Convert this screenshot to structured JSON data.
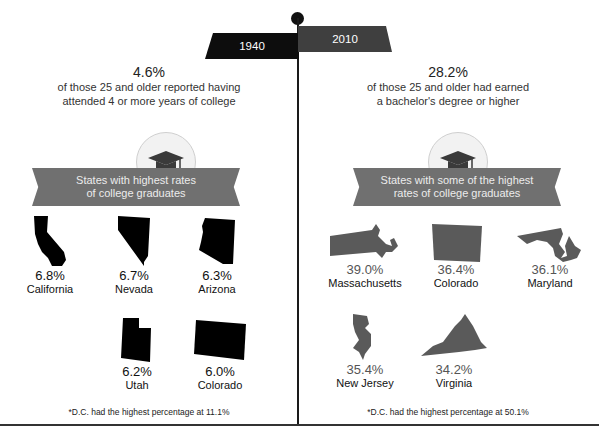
{
  "timeline": {
    "left_year": "1940",
    "right_year": "2010"
  },
  "left": {
    "percent": "4.6%",
    "description_line1": "of those 25 and older reported having",
    "description_line2": "attended 4 or more years of college",
    "icon": "graduation-cap-icon",
    "ribbon_line1": "States with highest rates",
    "ribbon_line2": "of college graduates",
    "states": [
      {
        "value": "6.8%",
        "name": "California",
        "shape": "california-map-icon"
      },
      {
        "value": "6.7%",
        "name": "Nevada",
        "shape": "nevada-map-icon"
      },
      {
        "value": "6.3%",
        "name": "Arizona",
        "shape": "arizona-map-icon"
      },
      {
        "value": "6.2%",
        "name": "Utah",
        "shape": "utah-map-icon"
      },
      {
        "value": "6.0%",
        "name": "Colorado",
        "shape": "colorado-map-icon"
      }
    ],
    "footnote": "*D.C. had the highest percentage at 11.1%",
    "shape_color": "#000000"
  },
  "right": {
    "percent": "28.2%",
    "description_line1": "of those 25 and older had earned",
    "description_line2": "a bachelor's degree or higher",
    "icon": "graduation-cap-icon",
    "ribbon_line1": "States with some of the highest",
    "ribbon_line2": "rates of college graduates",
    "states": [
      {
        "value": "39.0%",
        "name": "Massachusetts",
        "shape": "massachusetts-map-icon"
      },
      {
        "value": "36.4%",
        "name": "Colorado",
        "shape": "colorado-map-icon"
      },
      {
        "value": "36.1%",
        "name": "Maryland",
        "shape": "maryland-map-icon"
      },
      {
        "value": "35.4%",
        "name": "New Jersey",
        "shape": "new-jersey-map-icon"
      },
      {
        "value": "34.2%",
        "name": "Virginia",
        "shape": "virginia-map-icon"
      }
    ],
    "footnote": "*D.C. had the highest percentage at 50.1%",
    "shape_color": "#5a5a5a"
  },
  "colors": {
    "ribbon": "#707070",
    "year_1940_tab": "#0d0d0d",
    "year_2010_tab": "#3f3f3f"
  }
}
